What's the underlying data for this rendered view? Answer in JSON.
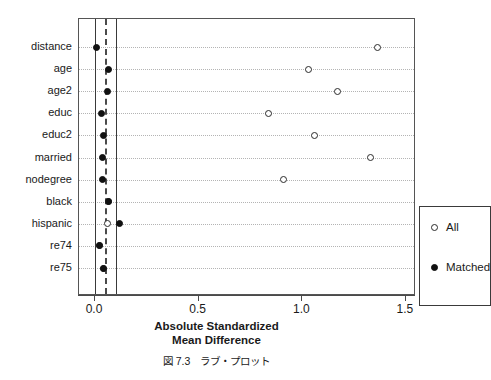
{
  "chart_data": {
    "type": "scatter",
    "title": "",
    "subtitle": "",
    "xlabel_line1": "Absolute Standardized",
    "xlabel_line2": "Mean Difference",
    "ylabel": "",
    "xlim": [
      -0.08,
      1.545
    ],
    "xticks": [
      0.0,
      0.5,
      1.0,
      1.5
    ],
    "xticklabels": [
      "0.0",
      "0.5",
      "1.0",
      "1.5"
    ],
    "grid": "horizontal-dotted",
    "legend_position": "bottom-right",
    "reference_lines": [
      {
        "value": 0.0,
        "style": "solid"
      },
      {
        "value": 0.05,
        "style": "dashed"
      },
      {
        "value": 0.1,
        "style": "solid"
      }
    ],
    "categories": [
      "distance",
      "age",
      "age2",
      "educ",
      "educ2",
      "married",
      "nodegree",
      "black",
      "hispanic",
      "re74",
      "re75"
    ],
    "series": [
      {
        "name": "All",
        "marker": "open-circle",
        "values": [
          1.365,
          1.032,
          1.172,
          0.835,
          1.061,
          1.327,
          0.907,
          0.063,
          0.058,
          0.024,
          0.039
        ]
      },
      {
        "name": "Matched",
        "marker": "filled-circle",
        "values": [
          0.005,
          0.063,
          0.058,
          0.029,
          0.039,
          0.034,
          0.034,
          0.063,
          0.116,
          0.024,
          0.039
        ]
      }
    ]
  },
  "legend": {
    "entries": [
      {
        "label": "All",
        "marker": "open-circle"
      },
      {
        "label": "Matched",
        "marker": "filled-circle"
      }
    ]
  },
  "caption": {
    "text": "図 7.3　ラブ・プロット"
  },
  "colors": {
    "marker_stroke": "#2b2b2b",
    "marker_fill": "#111111",
    "frame": "#555555",
    "grid": "#b4b4b4",
    "reference_solid": "#3a3a3a",
    "reference_dashed": "#4a4a4a",
    "text": "#1a1a1a",
    "background": "#ffffff"
  }
}
